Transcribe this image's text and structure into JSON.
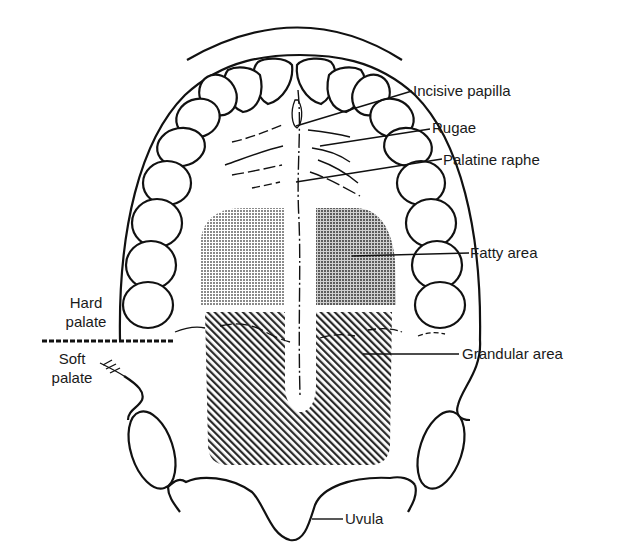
{
  "diagram": {
    "labels": {
      "incisive_papilla": "Incisive papilla",
      "rugae": "Rugae",
      "palatine_raphe": "Palatine raphe",
      "fatty_area": "Fatty area",
      "grandular_area": "Grandular area",
      "hard_palate_1": "Hard",
      "hard_palate_2": "palate",
      "soft_palate_1": "Soft",
      "soft_palate_2": "palate",
      "uvula": "Uvula"
    },
    "colors": {
      "line": "#111111",
      "fatty_fill": "#9a9a9a",
      "fatty_fill_dark": "#7c7c7c",
      "hatch": "#2a2a2a",
      "background": "#ffffff"
    }
  }
}
